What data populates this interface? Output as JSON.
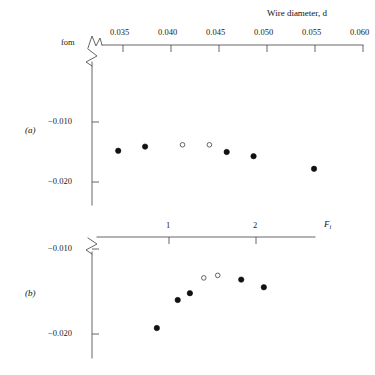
{
  "figure": {
    "top_axis_title": "Wire diameter, d",
    "top_axis_title_italic_var": "d",
    "y_axis_label": "fom",
    "panel_a_label": "(a)",
    "panel_b_label": "(b)",
    "panel_b_axis_title_var": "F",
    "panel_b_axis_title_sub": "i"
  },
  "chart_data": [
    {
      "type": "scatter",
      "panel": "(a)",
      "title": "",
      "xlabel": "Wire diameter, d",
      "ylabel": "fom",
      "xticks": [
        0.035,
        0.04,
        0.045,
        0.05,
        0.055,
        0.06
      ],
      "xtick_labels": [
        "0.035",
        "0.040",
        "0.045",
        "0.050",
        "0.055",
        "0.060"
      ],
      "xlim": [
        0.0315,
        0.0605
      ],
      "yticks": [
        -0.01,
        -0.02
      ],
      "ytick_labels": [
        "−0.010",
        "−0.020"
      ],
      "ylim": [
        -0.0225,
        -0.0062
      ],
      "axis_break_x": true,
      "axis_break_y": true,
      "grid": false,
      "legend": "none",
      "series": [
        {
          "name": "filled",
          "marker": "filled-circle",
          "x": [
            0.0345,
            0.0373,
            0.0458,
            0.0486,
            0.0549
          ],
          "y": [
            -0.0148,
            -0.0141,
            -0.015,
            -0.0157,
            -0.0178
          ]
        },
        {
          "name": "open",
          "marker": "open-circle",
          "x": [
            0.0412,
            0.044
          ],
          "y": [
            -0.0138,
            -0.0138
          ]
        }
      ]
    },
    {
      "type": "scatter",
      "panel": "(b)",
      "title": "",
      "xlabel": "F_i",
      "ylabel": "fom",
      "xticks": [
        1,
        2
      ],
      "xtick_labels": [
        "1",
        "2"
      ],
      "xlim": [
        0.46,
        2.66
      ],
      "yticks": [
        -0.01,
        -0.02
      ],
      "ytick_labels": [
        "−0.010",
        "−0.020"
      ],
      "ylim": [
        -0.0222,
        -0.0079
      ],
      "axis_break_x": true,
      "axis_break_y": true,
      "grid": false,
      "legend": "none",
      "series": [
        {
          "name": "filled",
          "marker": "filled-circle",
          "x": [
            0.86,
            1.1,
            1.24,
            1.83,
            2.09
          ],
          "y": [
            -0.0193,
            -0.016,
            -0.0152,
            -0.0136,
            -0.0145
          ]
        },
        {
          "name": "open",
          "marker": "open-circle",
          "x": [
            1.4,
            1.56
          ],
          "y": [
            -0.0134,
            -0.0131
          ]
        }
      ]
    }
  ]
}
